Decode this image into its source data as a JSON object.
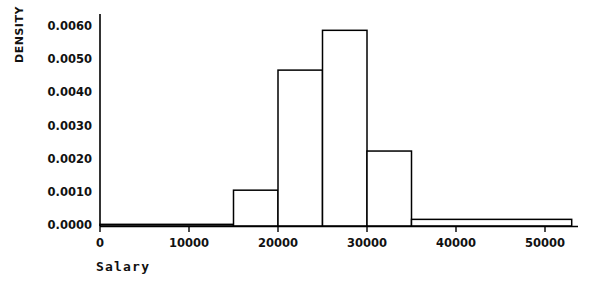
{
  "chart_data": {
    "type": "bar",
    "title": "",
    "subtitle": "",
    "xlabel": "Salary",
    "ylabel": "DENSITY",
    "grid": false,
    "legend": false,
    "histogram": true,
    "bin_edges": [
      0,
      15000,
      20000,
      25000,
      30000,
      35000,
      53000
    ],
    "categories": [
      "0-15000",
      "15000-20000",
      "20000-25000",
      "25000-30000",
      "30000-35000",
      "35000-53000"
    ],
    "values": [
      5e-05,
      0.00108,
      0.0047,
      0.0059,
      0.00226,
      0.0002
    ],
    "xlim": [
      0,
      53500
    ],
    "ylim": [
      0,
      0.0062
    ],
    "xticks": [
      0,
      10000,
      20000,
      30000,
      40000,
      50000
    ],
    "xtick_labels": [
      "0",
      "10000",
      "20000",
      "30000",
      "40000",
      "50000"
    ],
    "yticks": [
      0.0,
      0.001,
      0.002,
      0.003,
      0.004,
      0.005,
      0.006
    ],
    "ytick_labels": [
      "0.0000",
      "0.0010",
      "0.0020",
      "0.0030",
      "0.0040",
      "0.0050",
      "0.0060"
    ],
    "bar_fill_color": "#ffffff",
    "bar_edge_color": "#000000",
    "axis_color": "#000000",
    "background_color": "#ffffff"
  }
}
